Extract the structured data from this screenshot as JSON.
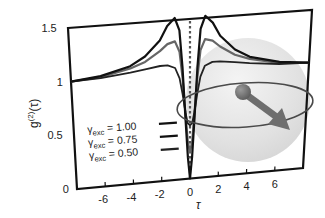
{
  "chart_data": {
    "type": "line",
    "title": "",
    "xlabel": "τ",
    "ylabel": "g(2)(τ)",
    "ylabel_parts": {
      "base": "g",
      "sup": "(2)",
      "arg": "(τ)"
    },
    "xlim": [
      -8,
      8
    ],
    "ylim": [
      0,
      1.5
    ],
    "x_ticks": [
      -6,
      -4,
      -2,
      0,
      2,
      4,
      6
    ],
    "x_tick_labels": [
      "-6",
      "-4",
      "-2",
      "0",
      "2",
      "4",
      "6"
    ],
    "y_ticks": [
      0,
      0.5,
      1,
      1.5
    ],
    "y_tick_labels": [
      "0",
      "0.5",
      "1",
      "1.5"
    ],
    "grid": false,
    "reference_line": {
      "x": 0,
      "style": "dotted",
      "color": "#555555"
    },
    "legend_position": "lower-left-inside",
    "series": [
      {
        "name": "γexc = 1.00",
        "label_main": "γ",
        "label_sub": "exc",
        "label_value": "= 1.00",
        "color": "#111111",
        "width": 2.2,
        "x": [
          -8,
          -6,
          -4,
          -3,
          -2,
          -1.5,
          -1,
          -0.7,
          -0.5,
          -0.3,
          -0.15,
          0,
          0.15,
          0.3,
          0.5,
          0.7,
          1,
          1.5,
          2,
          3,
          4,
          6,
          8
        ],
        "values": [
          1.0,
          1.03,
          1.1,
          1.18,
          1.32,
          1.45,
          1.52,
          1.4,
          1.05,
          0.55,
          0.2,
          0.0,
          0.2,
          0.55,
          1.05,
          1.4,
          1.52,
          1.45,
          1.32,
          1.18,
          1.1,
          1.03,
          1.0
        ]
      },
      {
        "name": "γexc = 0.75",
        "label_main": "γ",
        "label_sub": "exc",
        "label_value": "= 0.75",
        "color": "#666666",
        "width": 2.2,
        "x": [
          -8,
          -6,
          -4,
          -3,
          -2,
          -1.5,
          -1,
          -0.7,
          -0.5,
          -0.3,
          -0.15,
          0,
          0.15,
          0.3,
          0.5,
          0.7,
          1,
          1.5,
          2,
          3,
          4,
          6,
          8
        ],
        "values": [
          1.0,
          1.02,
          1.08,
          1.13,
          1.22,
          1.28,
          1.3,
          1.2,
          0.95,
          0.6,
          0.35,
          0.25,
          0.35,
          0.6,
          0.95,
          1.2,
          1.3,
          1.28,
          1.22,
          1.13,
          1.08,
          1.02,
          1.0
        ]
      },
      {
        "name": "γexc = 0.50",
        "label_main": "γ",
        "label_sub": "exc",
        "label_value": "= 0.50",
        "color": "#222222",
        "width": 1.8,
        "x": [
          -8,
          -6,
          -4,
          -3,
          -2,
          -1.5,
          -1,
          -0.7,
          -0.5,
          -0.3,
          -0.15,
          0,
          0.15,
          0.3,
          0.5,
          0.7,
          1,
          1.5,
          2,
          3,
          4,
          6,
          8
        ],
        "values": [
          1.0,
          1.01,
          1.04,
          1.06,
          1.08,
          1.08,
          1.05,
          0.95,
          0.8,
          0.62,
          0.52,
          0.5,
          0.52,
          0.62,
          0.8,
          0.95,
          1.05,
          1.08,
          1.08,
          1.06,
          1.04,
          1.01,
          1.0
        ]
      }
    ],
    "annotations": [
      {
        "type": "bloch-sphere-illustration",
        "description": "translucent grey sphere with equatorial ellipse and a grey arrow pointing down-right"
      }
    ]
  },
  "frame": {
    "top_left": [
      68,
      28
    ],
    "top_right": [
      312,
      10
    ],
    "bottom_right": [
      303,
      168
    ],
    "bottom_left": [
      77,
      189
    ]
  },
  "colors": {
    "axis": "#111111",
    "sphere": "#d8d8d8",
    "arrow": "#6e6e6e",
    "ellipse": "#4a4a4a"
  }
}
